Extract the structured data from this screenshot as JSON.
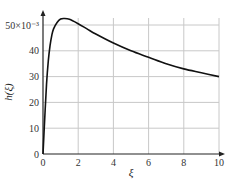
{
  "chart_data": {
    "type": "line",
    "title": "",
    "xlabel": "ξ",
    "ylabel": "h(ξ)",
    "y_multiplier_label": "×10⁻³",
    "xlim": [
      0,
      10
    ],
    "ylim": [
      0,
      55
    ],
    "x_ticks": [
      "0",
      "2",
      "4",
      "6",
      "8",
      "10"
    ],
    "y_ticks": [
      "0",
      "10",
      "20",
      "30",
      "40",
      "50"
    ],
    "grid": true,
    "legend": null,
    "series": [
      {
        "name": "h(ξ)",
        "x": [
          0,
          0.1,
          0.2,
          0.3,
          0.4,
          0.5,
          0.6,
          0.8,
          1.0,
          1.2,
          1.5,
          2,
          2.5,
          3,
          4,
          5,
          6,
          7,
          8,
          9,
          10
        ],
        "values": [
          0,
          14,
          27,
          36,
          42,
          46,
          48.5,
          51,
          52.3,
          52.5,
          52.2,
          50.5,
          48.5,
          46.5,
          43,
          40,
          37.5,
          35,
          33,
          31.5,
          30
        ]
      }
    ]
  }
}
